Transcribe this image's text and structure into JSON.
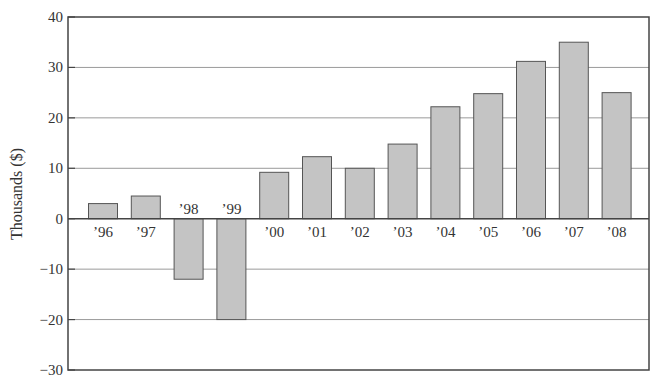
{
  "chart_data": {
    "type": "bar",
    "title": "",
    "xlabel": "",
    "ylabel": "Thousands ($)",
    "ylim": [
      -30,
      40
    ],
    "yticks": [
      40,
      30,
      20,
      10,
      0,
      -10,
      -20,
      -30
    ],
    "ytick_labels": [
      "40",
      "30",
      "20",
      "10",
      "0",
      "−10",
      "−20",
      "−30"
    ],
    "grid": true,
    "legend": null,
    "categories": [
      "’96",
      "’97",
      "’98",
      "’99",
      "’00",
      "’01",
      "’02",
      "’03",
      "’04",
      "’05",
      "’06",
      "’07",
      "’08"
    ],
    "values": [
      3,
      4.5,
      -12,
      -20,
      9.2,
      12.3,
      10,
      14.8,
      22.2,
      24.8,
      31.2,
      35,
      25
    ],
    "colors": {
      "bar_fill": "#c4c4c4",
      "bar_stroke": "#555555",
      "grid": "#9a9a9a",
      "axis": "#444444"
    }
  }
}
